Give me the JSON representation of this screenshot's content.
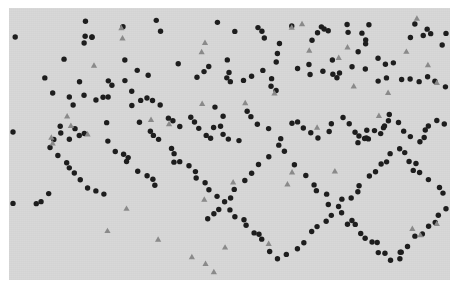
{
  "figure": {
    "name": "scatter-plot-figure",
    "width": 461,
    "height": 294,
    "background_color": "#ffffff"
  },
  "chart_data": {
    "type": "scatter",
    "title": "",
    "subtitle": "",
    "xlabel": "",
    "ylabel": "",
    "grid": false,
    "legend": "none",
    "axis_visible": false,
    "tick_labels_x": [],
    "tick_labels_y": [],
    "xlim": [
      0,
      441
    ],
    "ylim": [
      0,
      272
    ],
    "plot_area": {
      "x": 9,
      "y": 8,
      "width": 441,
      "height": 272,
      "facecolor": "#d7d7d7"
    },
    "series": [
      {
        "name": "circles",
        "marker": "circle",
        "color": "#1c1c1c",
        "size": 5.4,
        "count": 238,
        "points": [
          [
            232,
            32
          ],
          [
            233,
            45
          ],
          [
            235,
            55
          ],
          [
            249,
            54
          ],
          [
            358,
            27
          ],
          [
            370,
            40
          ],
          [
            456,
            32
          ],
          [
            478,
            34
          ],
          [
            180,
            40
          ],
          [
            182,
            48
          ],
          [
            238,
            62
          ],
          [
            240,
            85
          ],
          [
            250,
            98
          ],
          [
            118,
            68
          ],
          [
            182,
            52
          ],
          [
            122,
            72
          ],
          [
            200,
            67
          ],
          [
            204,
            77
          ],
          [
            106,
            86
          ],
          [
            146,
            90
          ],
          [
            162,
            92
          ],
          [
            40,
            66
          ],
          [
            44,
            78
          ],
          [
            70,
            88
          ],
          [
            206,
            86
          ],
          [
            230,
            96
          ],
          [
            236,
            104
          ],
          [
            262,
            94
          ],
          [
            298,
            98
          ],
          [
            340,
            96
          ],
          [
            352,
            104
          ],
          [
            380,
            100
          ],
          [
            398,
            86
          ],
          [
            416,
            92
          ],
          [
            438,
            94
          ],
          [
            462,
            74
          ],
          [
            488,
            82
          ],
          [
            500,
            90
          ],
          [
            515,
            86
          ],
          [
            540,
            96
          ],
          [
            586,
            60
          ],
          [
            610,
            58
          ],
          [
            624,
            44
          ],
          [
            648,
            56
          ],
          [
            664,
            62
          ],
          [
            672,
            74
          ],
          [
            690,
            80
          ],
          [
            700,
            92
          ],
          [
            716,
            100
          ],
          [
            736,
            98
          ],
          [
            748,
            92
          ],
          [
            760,
            84
          ],
          [
            772,
            76
          ],
          [
            780,
            64
          ],
          [
            794,
            56
          ],
          [
            812,
            46
          ],
          [
            826,
            36
          ],
          [
            840,
            30
          ]
        ],
        "note": "coordinates encoded in the compact point table below"
      },
      {
        "name": "triangles",
        "marker": "triangle",
        "color": "#8a8a8a",
        "size": 6.2,
        "count": 44,
        "points": []
      }
    ],
    "counts": {
      "circles": 238,
      "triangles": 44,
      "total": 282
    }
  },
  "points": {
    "circles": [
      [
        78,
        16
      ],
      [
        116,
        20
      ],
      [
        147,
        15
      ],
      [
        152,
        22
      ],
      [
        210,
        15
      ],
      [
        223,
        22
      ],
      [
        247,
        20
      ],
      [
        253,
        28
      ],
      [
        280,
        17
      ],
      [
        314,
        16
      ],
      [
        318,
        24
      ],
      [
        337,
        14
      ],
      [
        361,
        15
      ],
      [
        404,
        14
      ],
      [
        423,
        26
      ],
      [
        440,
        23
      ],
      [
        76,
        27
      ],
      [
        78,
        32
      ],
      [
        83,
        29
      ],
      [
        148,
        26
      ],
      [
        269,
        33
      ],
      [
        271,
        43
      ],
      [
        303,
        30
      ],
      [
        307,
        38
      ],
      [
        353,
        26
      ],
      [
        355,
        34
      ],
      [
        402,
        32
      ],
      [
        413,
        30
      ],
      [
        446,
        31
      ],
      [
        431,
        35
      ],
      [
        56,
        52
      ],
      [
        113,
        52
      ],
      [
        170,
        55
      ],
      [
        197,
        57
      ],
      [
        218,
        53
      ],
      [
        222,
        62
      ],
      [
        266,
        56
      ],
      [
        269,
        45
      ],
      [
        289,
        59
      ],
      [
        324,
        53
      ],
      [
        341,
        57
      ],
      [
        351,
        44
      ],
      [
        367,
        48
      ],
      [
        376,
        57
      ],
      [
        386,
        54
      ],
      [
        38,
        68
      ],
      [
        73,
        73
      ],
      [
        100,
        72
      ],
      [
        103,
        78
      ],
      [
        115,
        70
      ],
      [
        128,
        64
      ],
      [
        142,
        67
      ],
      [
        186,
        69
      ],
      [
        193,
        66
      ],
      [
        216,
        68
      ],
      [
        221,
        72
      ],
      [
        227,
        74
      ],
      [
        232,
        70
      ],
      [
        240,
        66
      ],
      [
        246,
        63
      ],
      [
        254,
        60
      ],
      [
        261,
        70
      ],
      [
        265,
        79
      ],
      [
        269,
        82
      ],
      [
        297,
        57
      ],
      [
        302,
        66
      ],
      [
        315,
        62
      ],
      [
        322,
        66
      ],
      [
        328,
        70
      ],
      [
        354,
        63
      ],
      [
        360,
        60
      ],
      [
        372,
        74
      ],
      [
        380,
        68
      ],
      [
        391,
        70
      ],
      [
        399,
        72
      ],
      [
        408,
        76
      ],
      [
        417,
        69
      ],
      [
        428,
        76
      ],
      [
        434,
        78
      ],
      [
        43,
        85
      ],
      [
        63,
        88
      ],
      [
        66,
        94
      ],
      [
        78,
        86
      ],
      [
        85,
        92
      ],
      [
        97,
        87
      ],
      [
        121,
        85
      ],
      [
        124,
        95
      ],
      [
        130,
        91
      ],
      [
        137,
        89
      ],
      [
        142,
        93
      ],
      [
        149,
        96
      ],
      [
        151,
        102
      ],
      [
        155,
        99
      ],
      [
        160,
        108
      ],
      [
        166,
        113
      ],
      [
        173,
        117
      ],
      [
        180,
        110
      ],
      [
        132,
        115
      ],
      [
        140,
        121
      ],
      [
        145,
        126
      ],
      [
        97,
        112
      ],
      [
        101,
        118
      ],
      [
        50,
        120
      ],
      [
        54,
        126
      ],
      [
        58,
        131
      ],
      [
        68,
        122
      ],
      [
        71,
        127
      ],
      [
        47,
        133
      ],
      [
        183,
        112
      ],
      [
        188,
        118
      ],
      [
        192,
        123
      ],
      [
        196,
        128
      ],
      [
        200,
        131
      ],
      [
        205,
        121
      ],
      [
        210,
        117
      ],
      [
        216,
        124
      ],
      [
        222,
        129
      ],
      [
        228,
        132
      ],
      [
        206,
        101
      ],
      [
        213,
        107
      ],
      [
        237,
        104
      ],
      [
        244,
        110
      ],
      [
        251,
        115
      ],
      [
        258,
        120
      ],
      [
        263,
        124
      ],
      [
        270,
        128
      ],
      [
        277,
        131
      ],
      [
        283,
        118
      ],
      [
        290,
        112
      ],
      [
        297,
        120
      ],
      [
        304,
        126
      ],
      [
        311,
        130
      ],
      [
        318,
        124
      ],
      [
        325,
        118
      ],
      [
        332,
        112
      ],
      [
        339,
        117
      ],
      [
        345,
        122
      ],
      [
        352,
        127
      ],
      [
        359,
        131
      ],
      [
        366,
        124
      ],
      [
        373,
        118
      ],
      [
        380,
        112
      ],
      [
        387,
        117
      ],
      [
        394,
        122
      ],
      [
        401,
        127
      ],
      [
        408,
        131
      ],
      [
        415,
        124
      ],
      [
        422,
        118
      ],
      [
        428,
        112
      ],
      [
        435,
        117
      ],
      [
        441,
        122
      ],
      [
        100,
        136
      ],
      [
        106,
        141
      ],
      [
        112,
        146
      ],
      [
        118,
        151
      ],
      [
        124,
        156
      ],
      [
        130,
        161
      ],
      [
        136,
        166
      ],
      [
        142,
        171
      ],
      [
        148,
        176
      ],
      [
        44,
        141
      ],
      [
        50,
        147
      ],
      [
        56,
        153
      ],
      [
        62,
        159
      ],
      [
        68,
        165
      ],
      [
        74,
        171
      ],
      [
        80,
        177
      ],
      [
        86,
        183
      ],
      [
        92,
        189
      ],
      [
        38,
        186
      ],
      [
        32,
        192
      ],
      [
        28,
        198
      ],
      [
        160,
        140
      ],
      [
        166,
        146
      ],
      [
        172,
        152
      ],
      [
        178,
        158
      ],
      [
        184,
        164
      ],
      [
        190,
        170
      ],
      [
        196,
        176
      ],
      [
        202,
        182
      ],
      [
        208,
        188
      ],
      [
        214,
        194
      ],
      [
        220,
        200
      ],
      [
        226,
        206
      ],
      [
        232,
        212
      ],
      [
        238,
        218
      ],
      [
        244,
        224
      ],
      [
        250,
        230
      ],
      [
        256,
        236
      ],
      [
        262,
        242
      ],
      [
        268,
        248
      ],
      [
        274,
        254
      ],
      [
        280,
        248
      ],
      [
        286,
        242
      ],
      [
        292,
        236
      ],
      [
        298,
        230
      ],
      [
        304,
        224
      ],
      [
        310,
        218
      ],
      [
        316,
        212
      ],
      [
        322,
        206
      ],
      [
        328,
        200
      ],
      [
        334,
        194
      ],
      [
        340,
        188
      ],
      [
        346,
        182
      ],
      [
        352,
        176
      ],
      [
        358,
        170
      ],
      [
        364,
        164
      ],
      [
        370,
        158
      ],
      [
        376,
        152
      ],
      [
        382,
        146
      ],
      [
        388,
        140
      ],
      [
        394,
        146
      ],
      [
        400,
        152
      ],
      [
        406,
        158
      ],
      [
        412,
        164
      ],
      [
        418,
        170
      ],
      [
        424,
        176
      ],
      [
        430,
        182
      ],
      [
        436,
        188
      ],
      [
        442,
        194
      ],
      [
        436,
        200
      ],
      [
        430,
        206
      ],
      [
        424,
        212
      ],
      [
        418,
        218
      ],
      [
        412,
        224
      ],
      [
        406,
        230
      ],
      [
        400,
        236
      ],
      [
        394,
        242
      ],
      [
        388,
        248
      ],
      [
        382,
        254
      ],
      [
        376,
        248
      ],
      [
        370,
        242
      ],
      [
        364,
        236
      ],
      [
        358,
        230
      ],
      [
        352,
        224
      ],
      [
        346,
        218
      ],
      [
        340,
        212
      ],
      [
        334,
        206
      ],
      [
        328,
        200
      ],
      [
        322,
        194
      ],
      [
        316,
        188
      ],
      [
        310,
        182
      ],
      [
        304,
        176
      ],
      [
        298,
        170
      ],
      [
        292,
        164
      ],
      [
        286,
        158
      ],
      [
        280,
        152
      ],
      [
        274,
        146
      ],
      [
        268,
        140
      ],
      [
        262,
        146
      ],
      [
        256,
        152
      ],
      [
        250,
        158
      ],
      [
        244,
        164
      ],
      [
        238,
        170
      ],
      [
        232,
        176
      ],
      [
        226,
        182
      ],
      [
        220,
        188
      ],
      [
        214,
        194
      ],
      [
        208,
        200
      ],
      [
        202,
        206
      ],
      [
        196,
        212
      ],
      [
        190,
        218
      ],
      [
        184,
        224
      ],
      [
        178,
        230
      ],
      [
        172,
        236
      ],
      [
        166,
        242
      ],
      [
        160,
        248
      ],
      [
        154,
        254
      ],
      [
        148,
        248
      ],
      [
        142,
        242
      ],
      [
        136,
        236
      ],
      [
        130,
        230
      ],
      [
        124,
        224
      ],
      [
        118,
        218
      ],
      [
        112,
        212
      ],
      [
        106,
        206
      ],
      [
        100,
        200
      ],
      [
        94,
        194
      ],
      [
        88,
        188
      ],
      [
        82,
        182
      ],
      [
        76,
        176
      ],
      [
        70,
        170
      ],
      [
        64,
        164
      ],
      [
        58,
        158
      ],
      [
        52,
        152
      ],
      [
        46,
        146
      ],
      [
        40,
        140
      ],
      [
        34,
        146
      ],
      [
        28,
        152
      ],
      [
        22,
        158
      ],
      [
        16,
        164
      ]
    ],
    "triangles": [
      [
        113,
        21
      ],
      [
        197,
        36
      ],
      [
        284,
        19
      ],
      [
        291,
        15
      ],
      [
        407,
        12
      ],
      [
        194,
        45
      ],
      [
        330,
        49
      ],
      [
        399,
        41
      ],
      [
        60,
        110
      ],
      [
        64,
        116
      ],
      [
        144,
        112
      ],
      [
        79,
        124
      ],
      [
        42,
        131
      ],
      [
        46,
        137
      ],
      [
        160,
        114
      ],
      [
        192,
        96
      ],
      [
        238,
        94
      ],
      [
        266,
        86
      ],
      [
        310,
        118
      ],
      [
        368,
        108
      ],
      [
        345,
        76
      ],
      [
        300,
        44
      ],
      [
        340,
        38
      ],
      [
        380,
        82
      ],
      [
        86,
        57
      ],
      [
        111,
        30
      ],
      [
        420,
        56
      ],
      [
        429,
        74
      ],
      [
        324,
        162
      ],
      [
        283,
        163
      ],
      [
        276,
        178
      ],
      [
        196,
        190
      ],
      [
        224,
        176
      ],
      [
        120,
        198
      ],
      [
        147,
        232
      ],
      [
        214,
        238
      ],
      [
        258,
        233
      ],
      [
        183,
        247
      ],
      [
        199,
        254
      ],
      [
        206,
        262
      ],
      [
        97,
        222
      ],
      [
        428,
        214
      ],
      [
        404,
        221
      ],
      [
        409,
        226
      ]
    ]
  },
  "elements": {
    "figure_name": "scatter-plot-figure",
    "panel_name": "plot-panel",
    "canvas_name": "scatter-canvas"
  }
}
